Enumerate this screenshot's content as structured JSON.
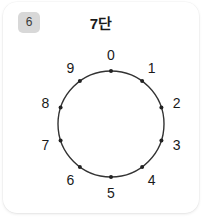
{
  "card": {
    "badge_label": "6",
    "title": "7단",
    "background_color": "#ffffff",
    "badge_color": "#d8d8d8"
  },
  "dial": {
    "name": "number-circle-dial",
    "center_x": 108,
    "center_y": 122,
    "radius": 53,
    "label_radius": 69,
    "stroke_color": "#333333",
    "dot_color": "#222222",
    "start_angle_deg": -90,
    "direction": "clockwise",
    "points": [
      {
        "label": "0",
        "index": 0
      },
      {
        "label": "1",
        "index": 1
      },
      {
        "label": "2",
        "index": 2
      },
      {
        "label": "3",
        "index": 3
      },
      {
        "label": "4",
        "index": 4
      },
      {
        "label": "5",
        "index": 5
      },
      {
        "label": "6",
        "index": 6
      },
      {
        "label": "7",
        "index": 7
      },
      {
        "label": "8",
        "index": 8
      },
      {
        "label": "9",
        "index": 9
      }
    ]
  },
  "chart_data": {
    "type": "scatter",
    "title": "7단",
    "xlabel": "",
    "ylabel": "",
    "categories": [
      "0",
      "1",
      "2",
      "3",
      "4",
      "5",
      "6",
      "7",
      "8",
      "9"
    ],
    "values": [
      0,
      1,
      2,
      3,
      4,
      5,
      6,
      7,
      8,
      9
    ],
    "layout": "circular-dial",
    "legend": "none",
    "grid": false
  }
}
